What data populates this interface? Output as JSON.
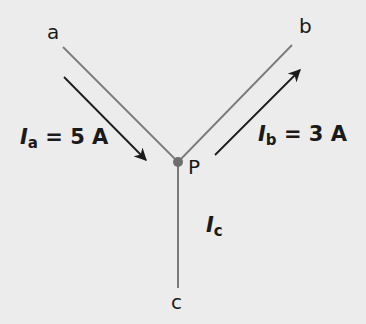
{
  "diagram": {
    "type": "circuit-junction",
    "background": "#ececec",
    "line_color": "#7a7a7a",
    "arrow_color": "#1a1a1a",
    "node_color": "#6e6e6e",
    "junction": {
      "label": "P"
    },
    "terminals": {
      "a": {
        "label": "a"
      },
      "b": {
        "label": "b"
      },
      "c": {
        "label": "c"
      }
    },
    "currents": {
      "a": {
        "symbol": "I",
        "subscript": "a",
        "value_text": " = 5 A",
        "direction": "into P"
      },
      "b": {
        "symbol": "I",
        "subscript": "b",
        "value_text": " = 3 A",
        "direction": "out of P toward b"
      },
      "c": {
        "symbol": "I",
        "subscript": "c",
        "value_text": ""
      }
    }
  }
}
